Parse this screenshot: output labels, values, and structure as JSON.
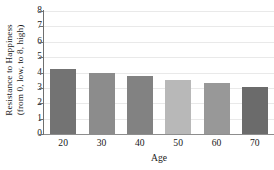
{
  "chart_data": {
    "type": "bar",
    "title": "",
    "categories": [
      "20",
      "30",
      "40",
      "50",
      "60",
      "70"
    ],
    "values": [
      4.2,
      4.0,
      3.75,
      3.5,
      3.3,
      3.05
    ],
    "bar_colors": [
      "#737373",
      "#8c8c8c",
      "#828282",
      "#b8b8b8",
      "#989898",
      "#6b6b6b"
    ],
    "xlabel": "Age",
    "ylabel_line1": "Resistance to Happiness",
    "ylabel_line2": "(from 0, low, to 8, high)",
    "ylim": [
      0,
      8
    ],
    "yticks": [
      "0",
      "1",
      "2",
      "3",
      "4",
      "5",
      "6",
      "7",
      "8"
    ],
    "grid": true,
    "legend": "none",
    "grid_color": "#e9e9e9",
    "axis_color": "#6f6f6f"
  }
}
